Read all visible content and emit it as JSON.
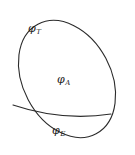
{
  "figure": {
    "background_color": "#ffffff",
    "stroke_color": "#2b2b2b",
    "labels": {
      "outer_boundary": {
        "base": "φ",
        "subscript": "T",
        "full": "φT"
      },
      "upper_region": {
        "base": "φ",
        "subscript": "A",
        "full": "φA"
      },
      "lower_region": {
        "base": "φ",
        "subscript": "E",
        "full": "φE"
      }
    },
    "geometry": {
      "ellipse": {
        "center_x": 67,
        "center_y": 79,
        "radius_x": 44,
        "radius_y": 62,
        "rotation_deg": -28,
        "stroke_width": 1.1
      },
      "chord": {
        "start_x": 13,
        "start_y": 105,
        "end_x": 111,
        "end_y": 114,
        "sag": 6,
        "stroke_width": 1.1
      }
    }
  }
}
